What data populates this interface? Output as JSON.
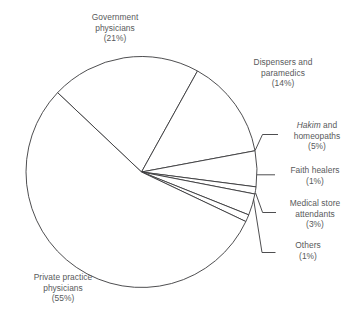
{
  "chart_data": {
    "type": "pie",
    "title": "",
    "subtitle": "",
    "xlabel": "",
    "ylabel": "",
    "grid": false,
    "legend": "none",
    "label_style": "callout-with-leader-lines",
    "units": "percent",
    "total": 100,
    "categories": [
      "Government physicians",
      "Dispensers and paramedics",
      "Hakim and homeopaths",
      "Faith healers",
      "Medical store attendants",
      "Others",
      "Private practice physicians"
    ],
    "values": [
      21,
      14,
      5,
      1,
      3,
      1,
      55
    ],
    "slice_fill": "#ffffff",
    "slice_stroke": "#3a3a3c",
    "text_color": "#58595b",
    "slices": [
      {
        "key": "government",
        "name_line1": "Government",
        "name_line2": "physicians",
        "name_line3": "",
        "value": 21,
        "value_label": "(21%)",
        "start_deg": -136.6,
        "end_deg": -61.0
      },
      {
        "key": "dispensers",
        "name_line1": "Dispensers and",
        "name_line2": "paramedics",
        "name_line3": "",
        "value": 14,
        "value_label": "(14%)",
        "start_deg": -61.0,
        "end_deg": -10.6
      },
      {
        "key": "hakim",
        "name_line1": "Hakim",
        "name_line1_italic": true,
        "name_line1_suffix": " and",
        "name_line2": "homeopaths",
        "name_line3": "",
        "value": 5,
        "value_label": "(5%)",
        "start_deg": -10.6,
        "end_deg": 7.4
      },
      {
        "key": "faith",
        "name_line1": "Faith healers",
        "name_line2": "",
        "name_line3": "",
        "value": 1,
        "value_label": "(1%)",
        "start_deg": 7.4,
        "end_deg": 11.0
      },
      {
        "key": "medstore",
        "name_line1": "Medical store",
        "name_line2": "attendants",
        "name_line3": "",
        "value": 3,
        "value_label": "(3%)",
        "start_deg": 11.0,
        "end_deg": 21.8
      },
      {
        "key": "others",
        "name_line1": "Others",
        "name_line2": "",
        "name_line3": "",
        "value": 1,
        "value_label": "(1%)",
        "start_deg": 21.8,
        "end_deg": 25.4
      },
      {
        "key": "private",
        "name_line1": "Private practice",
        "name_line2": "physicians",
        "name_line3": "",
        "value": 55,
        "value_label": "(55%)",
        "start_deg": 25.4,
        "end_deg": 223.4
      }
    ]
  },
  "geometry": {
    "cx": 141.5,
    "cy": 172,
    "r": 115.5
  },
  "labels": {
    "government": {
      "l1": "Government",
      "l2": "physicians",
      "pct": "(21%)"
    },
    "dispensers": {
      "l1": "Dispensers and",
      "l2": "paramedics",
      "pct": "(14%)"
    },
    "hakim": {
      "l1_em": "Hakim",
      "l1_rest": " and",
      "l2": "homeopaths",
      "pct": "(5%)"
    },
    "faith": {
      "l1": "Faith healers",
      "pct": "(1%)"
    },
    "medstore": {
      "l1": "Medical store",
      "l2": "attendants",
      "pct": "(3%)"
    },
    "others": {
      "l1": "Others",
      "pct": "(1%)"
    },
    "private": {
      "l1": "Private practice",
      "l2": "physicians",
      "pct": "(55%)"
    }
  }
}
